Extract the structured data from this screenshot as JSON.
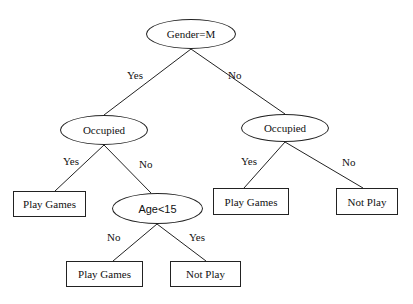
{
  "diagram": {
    "type": "decision-tree",
    "nodes": {
      "root": {
        "label": "Gender=M",
        "shape": "ellipse"
      },
      "left_occupied": {
        "label": "Occupied",
        "shape": "ellipse"
      },
      "right_occupied": {
        "label": "Occupied",
        "shape": "ellipse"
      },
      "age": {
        "label": "Age<15",
        "shape": "ellipse"
      },
      "leaf_left_play": {
        "label": "Play Games",
        "shape": "box"
      },
      "leaf_right_play": {
        "label": "Play Games",
        "shape": "box"
      },
      "leaf_right_notplay": {
        "label": "Not Play",
        "shape": "box"
      },
      "leaf_age_play": {
        "label": "Play Games",
        "shape": "box"
      },
      "leaf_age_notplay": {
        "label": "Not Play",
        "shape": "box"
      }
    },
    "edges": {
      "root_yes": {
        "label": "Yes",
        "from": "root",
        "to": "left_occupied"
      },
      "root_no": {
        "label": "No",
        "from": "root",
        "to": "right_occupied"
      },
      "left_yes": {
        "label": "Yes",
        "from": "left_occupied",
        "to": "leaf_left_play"
      },
      "left_no": {
        "label": "No",
        "from": "left_occupied",
        "to": "age"
      },
      "right_yes": {
        "label": "Yes",
        "from": "right_occupied",
        "to": "leaf_right_play"
      },
      "right_no": {
        "label": "No",
        "from": "right_occupied",
        "to": "leaf_right_notplay"
      },
      "age_no": {
        "label": "No",
        "from": "age",
        "to": "leaf_age_play"
      },
      "age_yes": {
        "label": "Yes",
        "from": "age",
        "to": "leaf_age_notplay"
      }
    }
  }
}
